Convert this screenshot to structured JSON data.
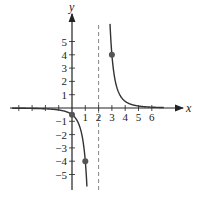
{
  "chart_data": {
    "type": "line",
    "function": "y = 4/(x-2)^3",
    "title": "",
    "xlabel": "x",
    "ylabel": "y",
    "xlim": [
      -4.5,
      7
    ],
    "ylim": [
      -6,
      6.5
    ],
    "x_ticks": [
      -4,
      -3,
      -2,
      -1,
      1,
      2,
      3,
      4,
      5,
      6
    ],
    "x_tick_labels": [
      "1",
      "2",
      "3",
      "4",
      "5",
      "6"
    ],
    "x_tick_label_values": [
      1,
      2,
      3,
      4,
      5,
      6
    ],
    "y_tick_labels": [
      "5",
      "4",
      "3",
      "2",
      "1",
      "-1",
      "-2",
      "-3",
      "-4",
      "-5"
    ],
    "y_tick_label_values": [
      5,
      4,
      3,
      2,
      1,
      -1,
      -2,
      -3,
      -4,
      -5
    ],
    "asymptotes": {
      "vertical": 2,
      "horizontal": 0
    },
    "points": [
      {
        "x": 0,
        "y": -0.5
      },
      {
        "x": 1,
        "y": -4
      },
      {
        "x": 3,
        "y": 4
      }
    ],
    "grid": false,
    "legend": "none"
  }
}
